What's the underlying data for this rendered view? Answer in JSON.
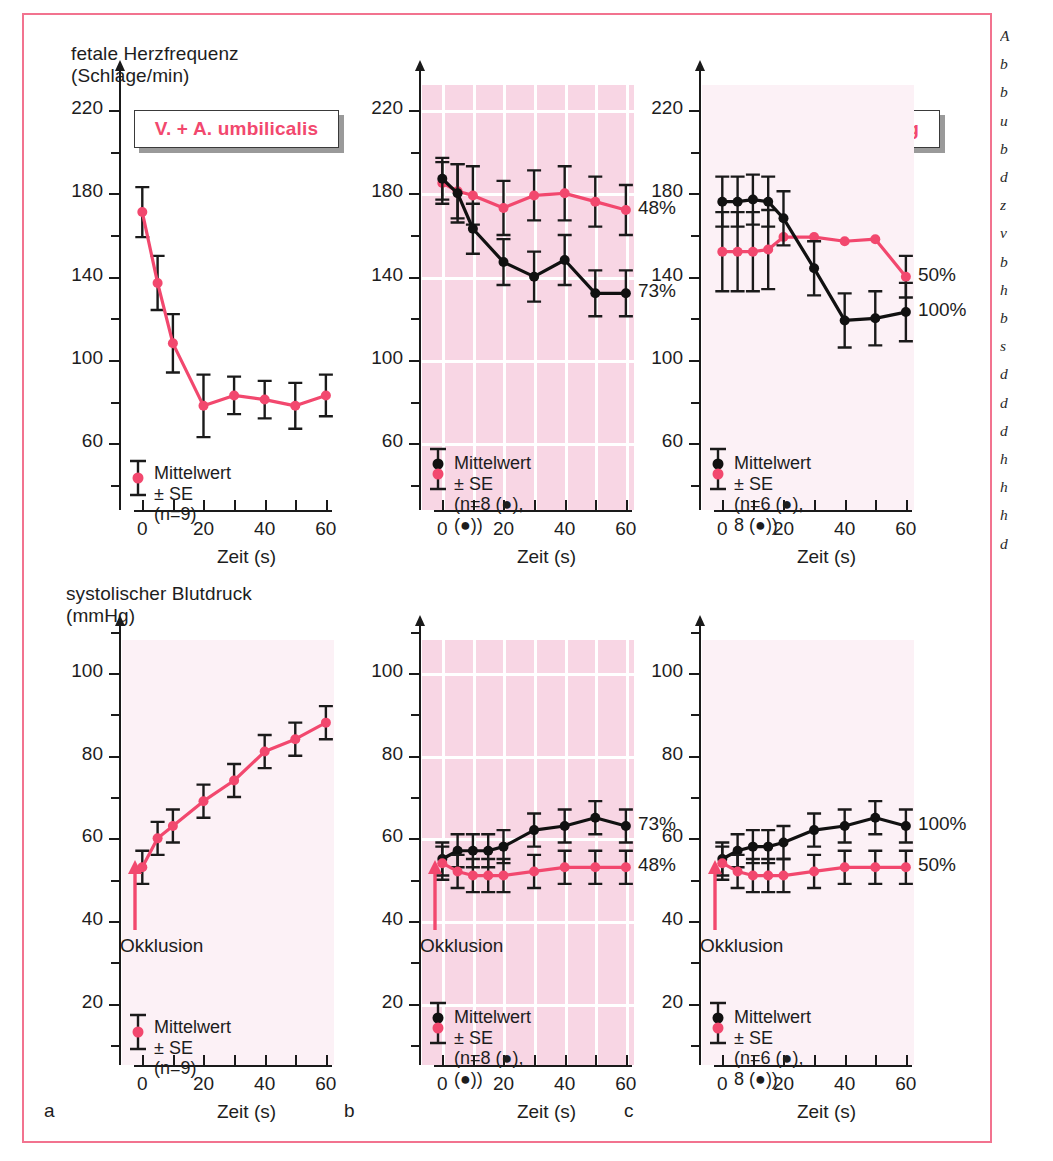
{
  "figure": {
    "hr_axis_title": "fetale Herzfrequenz\n(Schläge/min)",
    "bp_axis_title": "systolischer Blutdruck\n(mmHg)",
    "panel_letters": [
      "a",
      "b",
      "c"
    ],
    "occlusion_label": "Okklusion",
    "xaxis_caption": "Zeit (s)",
    "colors": {
      "accent_pink": "#f2486e",
      "frame_pink": "#f2738f",
      "shade_pink": "#f8d6e4",
      "black_series": "#111111",
      "grid_white": "#ffffff"
    },
    "plaques": [
      "V. + A.  umbilicalis",
      "V. umbilicalis",
      "Uterusdurchblutung"
    ],
    "legends": {
      "a": "Mittelwert ± SE (n=9)",
      "b": "Mittelwert ± SE\n(n=8 (●), (●))",
      "c": "Mittelwert ± SE\n(n=6 (●), 8 (●))"
    },
    "margin_caption_lines": [
      "A",
      "b",
      "b",
      "u",
      "b",
      "d",
      "z",
      "v",
      "b",
      "h",
      "b",
      "s",
      "d",
      "d",
      "d",
      "h",
      "h",
      "h",
      "d"
    ]
  },
  "chart_data": [
    {
      "id": "a-top",
      "type": "line",
      "title": "V. + A.  umbilicalis",
      "ylabel": "fetale Herzfrequenz (Schläge/min)",
      "xlabel": "Zeit (s)",
      "xlim": [
        -5,
        62
      ],
      "ylim": [
        40,
        232
      ],
      "yticks": [
        60,
        100,
        140,
        180,
        220
      ],
      "yticks_minor": [
        80,
        120,
        160,
        200
      ],
      "xticks": [
        0,
        20,
        40,
        60
      ],
      "xticks_minor": [
        10,
        30,
        50
      ],
      "grid": false,
      "legend": "Mittelwert ± SE (n=9)",
      "series": [
        {
          "name": "V. + A. umbilicalis",
          "color": "#f2486e",
          "marker": "circle",
          "x": [
            0,
            5,
            10,
            20,
            30,
            40,
            50,
            60
          ],
          "values": [
            171,
            137,
            108,
            78,
            83,
            81,
            78,
            83
          ],
          "err": [
            12,
            13,
            14,
            15,
            9,
            9,
            11,
            10
          ]
        }
      ]
    },
    {
      "id": "b-top",
      "type": "line",
      "title": "V. umbilicalis",
      "ylabel": "fetale Herzfrequenz (Schläge/min)",
      "xlabel": "Zeit (s)",
      "xlim": [
        -5,
        62
      ],
      "ylim": [
        40,
        232
      ],
      "yticks": [
        60,
        100,
        140,
        180,
        220
      ],
      "xticks": [
        0,
        20,
        40,
        60
      ],
      "xticks_minor": [
        10,
        30,
        50
      ],
      "grid": true,
      "legend": "Mittelwert ± SE\n(n=8 (●), (●))",
      "annotations": [
        {
          "text": "48%",
          "series": "pink"
        },
        {
          "text": "73%",
          "series": "black"
        }
      ],
      "series": [
        {
          "name": "48%",
          "color": "#f2486e",
          "marker": "circle",
          "x": [
            0,
            5,
            10,
            20,
            30,
            40,
            50,
            60
          ],
          "values": [
            185,
            181,
            179,
            173,
            179,
            180,
            176,
            172
          ],
          "err": [
            10,
            13,
            14,
            13,
            12,
            13,
            12,
            12
          ]
        },
        {
          "name": "73%",
          "color": "#111111",
          "marker": "circle",
          "x": [
            0,
            5,
            10,
            20,
            30,
            40,
            50,
            60
          ],
          "values": [
            187,
            180,
            163,
            147,
            140,
            148,
            132,
            132
          ],
          "err": [
            10,
            14,
            12,
            11,
            12,
            12,
            11,
            11
          ]
        }
      ]
    },
    {
      "id": "c-top",
      "type": "line",
      "title": "Uterusdurchblutung",
      "ylabel": "fetale Herzfrequenz (Schläge/min)",
      "xlabel": "Zeit (s)",
      "xlim": [
        -5,
        62
      ],
      "ylim": [
        40,
        232
      ],
      "yticks": [
        60,
        100,
        140,
        180,
        220
      ],
      "xticks": [
        0,
        20,
        40,
        60
      ],
      "xticks_minor": [
        10,
        30,
        50
      ],
      "grid": false,
      "legend": "Mittelwert ± SE\n(n=6 (●), 8 (●))",
      "annotations": [
        {
          "text": "50%",
          "series": "pink"
        },
        {
          "text": "100%",
          "series": "black"
        }
      ],
      "series": [
        {
          "name": "50%",
          "color": "#f2486e",
          "marker": "circle",
          "x": [
            0,
            5,
            10,
            15,
            20,
            30,
            40,
            50,
            60
          ],
          "values": [
            152,
            152,
            152,
            153,
            159,
            159,
            157,
            158,
            140
          ],
          "err": [
            19,
            19,
            19,
            19,
            0,
            0,
            0,
            0,
            10
          ]
        },
        {
          "name": "100%",
          "color": "#111111",
          "marker": "circle",
          "x": [
            0,
            5,
            10,
            15,
            20,
            30,
            40,
            50,
            60
          ],
          "values": [
            176,
            176,
            177,
            176,
            168,
            144,
            119,
            120,
            123
          ],
          "err": [
            12,
            12,
            12,
            12,
            13,
            13,
            13,
            13,
            14
          ]
        }
      ]
    },
    {
      "id": "a-bottom",
      "type": "line",
      "title": "",
      "ylabel": "systolischer Blutdruck (mmHg)",
      "xlabel": "Zeit (s)",
      "xlim": [
        -5,
        62
      ],
      "ylim": [
        10,
        108
      ],
      "yticks": [
        20,
        40,
        60,
        80,
        100
      ],
      "yticks_minor": [
        30,
        50,
        70,
        90
      ],
      "xticks": [
        0,
        20,
        40,
        60
      ],
      "xticks_minor": [
        10,
        30,
        50
      ],
      "grid": false,
      "legend": "Mittelwert ± SE (n=9)",
      "arrow_label": "Okklusion",
      "series": [
        {
          "name": "V. + A. umbilicalis",
          "color": "#f2486e",
          "marker": "circle",
          "x": [
            0,
            5,
            10,
            20,
            30,
            40,
            50,
            60
          ],
          "values": [
            53,
            60,
            63,
            69,
            74,
            81,
            84,
            88
          ],
          "err": [
            4,
            4,
            4,
            4,
            4,
            4,
            4,
            4
          ]
        }
      ]
    },
    {
      "id": "b-bottom",
      "type": "line",
      "title": "",
      "ylabel": "systolischer Blutdruck (mmHg)",
      "xlabel": "Zeit (s)",
      "xlim": [
        -5,
        62
      ],
      "ylim": [
        10,
        108
      ],
      "yticks": [
        20,
        40,
        60,
        80,
        100
      ],
      "xticks": [
        0,
        20,
        40,
        60
      ],
      "xticks_minor": [
        10,
        30,
        50
      ],
      "grid": true,
      "legend": "Mittelwert ± SE\n(n=8 (●), (●))",
      "arrow_label": "Okklusion",
      "annotations": [
        {
          "text": "73%",
          "series": "black"
        },
        {
          "text": "48%",
          "series": "pink"
        }
      ],
      "series": [
        {
          "name": "73%",
          "color": "#111111",
          "marker": "circle",
          "x": [
            0,
            5,
            10,
            15,
            20,
            30,
            40,
            50,
            60
          ],
          "values": [
            55,
            57,
            57,
            57,
            58,
            62,
            63,
            65,
            63
          ],
          "err": [
            4,
            4,
            4,
            4,
            4,
            4,
            4,
            4,
            4
          ]
        },
        {
          "name": "48%",
          "color": "#f2486e",
          "marker": "circle",
          "x": [
            0,
            5,
            10,
            15,
            20,
            30,
            40,
            50,
            60
          ],
          "values": [
            54,
            52,
            51,
            51,
            51,
            52,
            53,
            53,
            53
          ],
          "err": [
            4,
            4,
            4,
            4,
            4,
            4,
            4,
            4,
            4
          ]
        }
      ]
    },
    {
      "id": "c-bottom",
      "type": "line",
      "title": "",
      "ylabel": "systolischer Blutdruck (mmHg)",
      "xlabel": "Zeit (s)",
      "xlim": [
        -5,
        62
      ],
      "ylim": [
        10,
        108
      ],
      "yticks": [
        20,
        40,
        60,
        80,
        100
      ],
      "xticks": [
        0,
        20,
        40,
        60
      ],
      "xticks_minor": [
        10,
        30,
        50
      ],
      "grid": false,
      "legend": "Mittelwert ± SE\n(n=6 (●), 8 (●))",
      "arrow_label": "Okklusion",
      "annotations": [
        {
          "text": "100%",
          "series": "black"
        },
        {
          "text": "50%",
          "series": "pink"
        }
      ],
      "series": [
        {
          "name": "100%",
          "color": "#111111",
          "marker": "circle",
          "x": [
            0,
            5,
            10,
            15,
            20,
            30,
            40,
            50,
            60
          ],
          "values": [
            55,
            57,
            58,
            58,
            59,
            62,
            63,
            65,
            63
          ],
          "err": [
            4,
            4,
            4,
            4,
            4,
            4,
            4,
            4,
            4
          ]
        },
        {
          "name": "50%",
          "color": "#f2486e",
          "marker": "circle",
          "x": [
            0,
            5,
            10,
            15,
            20,
            30,
            40,
            50,
            60
          ],
          "values": [
            54,
            52,
            51,
            51,
            51,
            52,
            53,
            53,
            53
          ],
          "err": [
            4,
            4,
            4,
            4,
            4,
            4,
            4,
            4,
            4
          ]
        }
      ]
    }
  ]
}
